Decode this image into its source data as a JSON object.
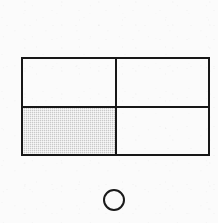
{
  "canvas": {
    "width": 218,
    "height": 223,
    "background_color": "#fbfbfb",
    "ink_color": "#171717",
    "shade_color": "#c9c9c9"
  },
  "figure": {
    "title": "",
    "shapes": [
      {
        "name": "rectangle",
        "type": "rectangle",
        "x": 21,
        "y": 57,
        "width": 189,
        "height": 99,
        "stroke_color": "#171717",
        "stroke_width": 2,
        "fill": "none",
        "partitions": {
          "columns": 2,
          "rows": 2,
          "total_parts": 4,
          "shaded_parts": 1,
          "fraction": "1/4"
        },
        "cells": [
          {
            "id": "top-left",
            "label": "top-left quadrant",
            "shaded": false,
            "fill": "none"
          },
          {
            "id": "top-right",
            "label": "top-right quadrant",
            "shaded": false,
            "fill": "none"
          },
          {
            "id": "bottom-left",
            "label": "bottom-left quadrant",
            "shaded": true,
            "fill": "#c9c9c9"
          },
          {
            "id": "bottom-right",
            "label": "bottom-right quadrant",
            "shaded": false,
            "fill": "none"
          }
        ],
        "dividers": [
          {
            "id": "vertical",
            "orientation": "vertical",
            "position_x": 115
          },
          {
            "id": "horizontal",
            "orientation": "horizontal",
            "position_y": 106
          }
        ]
      },
      {
        "name": "circle",
        "type": "circle",
        "center_x": 114,
        "center_y": 200,
        "radius": 11,
        "stroke_color": "#1a1a1a",
        "stroke_width": 2.6,
        "fill": "none",
        "shaded": false
      }
    ]
  }
}
